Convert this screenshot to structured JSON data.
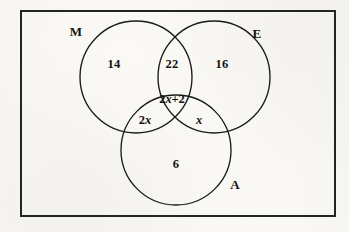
{
  "figure": {
    "type": "venn-diagram",
    "set_count": 3,
    "universal_set_shape": "rectangle"
  },
  "sets": [
    {
      "id": "M",
      "label": "M",
      "label_x": 76,
      "label_y": 31,
      "cx": 136,
      "cy": 77,
      "r": 56
    },
    {
      "id": "E",
      "label": "E",
      "label_x": 257,
      "label_y": 33,
      "cx": 214,
      "cy": 77,
      "r": 56
    },
    {
      "id": "A",
      "label": "A",
      "label_x": 235,
      "label_y": 184,
      "cx": 176,
      "cy": 150,
      "r": 55
    }
  ],
  "regions": [
    {
      "id": "m-only",
      "value": "14",
      "x": 114,
      "y": 64,
      "italic_tail": ""
    },
    {
      "id": "m-e",
      "value": "22",
      "x": 172,
      "y": 64,
      "italic_tail": ""
    },
    {
      "id": "e-only",
      "value": "16",
      "x": 222,
      "y": 64,
      "italic_tail": ""
    },
    {
      "id": "m-e-a",
      "value": "2",
      "x": 172,
      "y": 99,
      "italic_tail": "x",
      "suffix": "+2"
    },
    {
      "id": "m-a",
      "value": "2",
      "x": 145,
      "y": 120,
      "italic_tail": "x",
      "suffix": ""
    },
    {
      "id": "e-a",
      "value": "",
      "x": 199,
      "y": 120,
      "italic_tail": "x",
      "suffix": ""
    },
    {
      "id": "a-only",
      "value": "6",
      "x": 176,
      "y": 164,
      "italic_tail": ""
    }
  ],
  "universal_box": {
    "x": 21,
    "y": 11,
    "width": 314,
    "height": 205
  },
  "colors": {
    "stroke": "#1a1a1a",
    "text": "#15120f",
    "background": "#fbfaf7"
  }
}
